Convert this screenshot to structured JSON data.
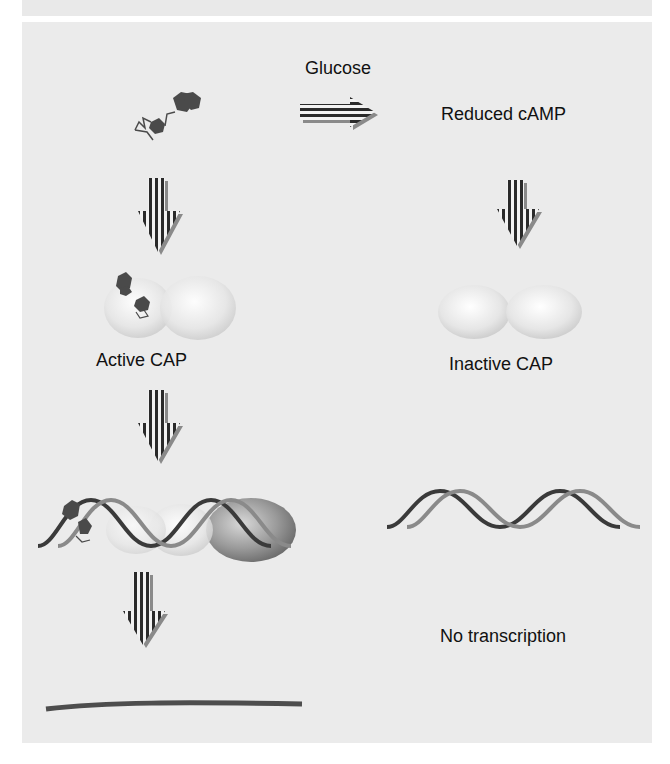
{
  "figure": {
    "colors": {
      "panel_bg": "#ebebeb",
      "molecule": "#4a4a4a",
      "arrow_dark": "#2a2a2a",
      "arrow_light": "#f2f2f2",
      "arrow_shadow": "#8a8a8a",
      "dna_strand": "#5a5a5a",
      "mrna_line": "#4d4d4d",
      "text": "#111111"
    }
  },
  "labels": {
    "glucose": "Glucose",
    "reduced_camp": "Reduced cAMP",
    "active_cap": "Active CAP",
    "inactive_cap": "Inactive CAP",
    "no_transcription": "No transcription"
  },
  "icons": {
    "camp_molecule": "camp-molecule-icon",
    "horizontal_arrow": "striped-right-arrow-icon",
    "down_arrow": "striped-down-arrow-icon",
    "cap_dimer": "cap-protein-dimer-icon",
    "dna_helix": "dna-double-helix-icon",
    "rna_polymerase": "rna-polymerase-icon",
    "mrna": "mrna-transcript-line-icon"
  },
  "left_path": {
    "steps": [
      "cAMP",
      "Active CAP",
      "CAP bound to DNA with RNA polymerase",
      "mRNA transcript"
    ]
  },
  "right_path": {
    "steps": [
      "Reduced cAMP",
      "Inactive CAP",
      "Free DNA",
      "No transcription"
    ]
  }
}
